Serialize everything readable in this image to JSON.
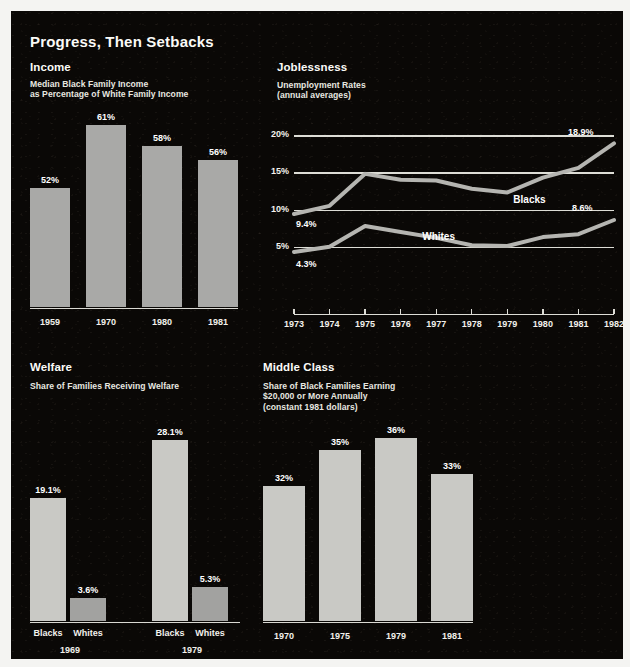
{
  "title": "Progress, Then Setbacks",
  "palette": {
    "background": "#0a0806",
    "page": "#f4f4f2",
    "text": "#f0efe9",
    "bar_gray": "#a9a9a7",
    "bar_light": "#c9c9c5",
    "bar_mid": "#a2a2a0",
    "gridline": "#ddddd6",
    "line": "#b5b5b1"
  },
  "sections": {
    "income": {
      "heading": "Income",
      "subheading": "Median Black Family Income\nas Percentage of White Family Income",
      "subheading_lines": [
        "Median Black Family Income",
        "as Percentage of White Family Income"
      ]
    },
    "joblessness": {
      "heading": "Joblessness",
      "subheading_lines": [
        "Unemployment Rates",
        "(annual averages)"
      ]
    },
    "welfare": {
      "heading": "Welfare",
      "subheading_lines": [
        "Share of Families Receiving Welfare"
      ]
    },
    "middleclass": {
      "heading": "Middle Class",
      "subheading_lines": [
        "Share of Black Families Earning",
        "$20,000 or More Annually",
        "(constant 1981 dollars)"
      ]
    }
  },
  "chart_data": [
    {
      "id": "income",
      "type": "bar",
      "title": "Income",
      "subtitle": "Median Black Family Income as Percentage of White Family Income",
      "categories": [
        "1959",
        "1970",
        "1980",
        "1981"
      ],
      "values": [
        52,
        61,
        58,
        56
      ],
      "labels": [
        "52%",
        "61%",
        "58%",
        "56%"
      ],
      "xlabel": "",
      "ylabel": "Percent of white family income",
      "ylim": [
        0,
        61
      ],
      "grid": false,
      "note": "bars drawn with suppressed zero baseline"
    },
    {
      "id": "joblessness",
      "type": "line",
      "title": "Joblessness",
      "subtitle": "Unemployment Rates (annual averages)",
      "x": [
        "1973",
        "1974",
        "1975",
        "1976",
        "1977",
        "1978",
        "1979",
        "1980",
        "1981",
        "1982"
      ],
      "ylim": [
        0,
        21.5
      ],
      "yticks": [
        5,
        10,
        15,
        20
      ],
      "ytick_labels": [
        "5%",
        "10%",
        "15%",
        "20%"
      ],
      "grid": true,
      "legend_position": "inline-annotation",
      "series": [
        {
          "name": "Blacks",
          "values": [
            9.4,
            10.5,
            14.8,
            14.0,
            13.9,
            12.8,
            12.3,
            14.3,
            15.6,
            18.9
          ],
          "endpoint_labels": {
            "start": "9.4%",
            "end": "18.9%"
          }
        },
        {
          "name": "Whites",
          "values": [
            4.3,
            5.0,
            7.8,
            7.0,
            6.2,
            5.2,
            5.1,
            6.3,
            6.7,
            8.6
          ],
          "endpoint_labels": {
            "start": "4.3%",
            "end": "8.6%"
          }
        }
      ],
      "annotations": [
        "18.9%",
        "8.6%",
        "9.4%",
        "4.3%",
        "Blacks",
        "Whites"
      ]
    },
    {
      "id": "welfare",
      "type": "bar",
      "title": "Welfare",
      "subtitle": "Share of Families Receiving Welfare",
      "groups": [
        "1969",
        "1979"
      ],
      "categories": [
        "Blacks",
        "Whites",
        "Blacks",
        "Whites"
      ],
      "values": [
        19.1,
        3.6,
        28.1,
        5.3
      ],
      "labels": [
        "19.1%",
        "3.6%",
        "28.1%",
        "5.3%"
      ],
      "ylim": [
        0,
        28.1
      ],
      "grid": false
    },
    {
      "id": "middleclass",
      "type": "bar",
      "title": "Middle Class",
      "subtitle": "Share of Black Families Earning $20,000 or More Annually (constant 1981 dollars)",
      "categories": [
        "1970",
        "1975",
        "1979",
        "1981"
      ],
      "values": [
        32,
        35,
        36,
        33
      ],
      "labels": [
        "32%",
        "35%",
        "36%",
        "33%"
      ],
      "ylim": [
        0,
        36
      ],
      "grid": false,
      "note": "bars drawn with suppressed zero baseline"
    }
  ]
}
